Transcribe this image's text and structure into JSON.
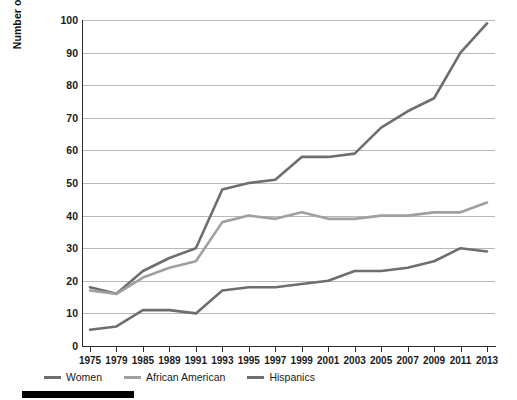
{
  "chart_data": {
    "type": "line",
    "title": "",
    "xlabel": "",
    "ylabel": "Number of  Women, African Americans, and Hispanics in the Congress",
    "x": [
      1975,
      1979,
      1985,
      1989,
      1991,
      1993,
      1995,
      1997,
      1999,
      2001,
      2003,
      2005,
      2007,
      2009,
      2011,
      2013
    ],
    "xticklabels": [
      "1975",
      "1979",
      "1985",
      "1989",
      "1991",
      "1993",
      "1995",
      "1997",
      "1999",
      "2001",
      "2003",
      "2005",
      "2007",
      "2009",
      "2011",
      "2013"
    ],
    "yticks": [
      0,
      10,
      20,
      30,
      40,
      50,
      60,
      70,
      80,
      90,
      100
    ],
    "yticklabels": [
      "0",
      "10",
      "20",
      "30",
      "40",
      "50",
      "60",
      "70",
      "80",
      "90",
      "100"
    ],
    "ylim": [
      0,
      100
    ],
    "grid": true,
    "legend_position": "below-axis-left",
    "series": [
      {
        "name": "Women",
        "color": "#6e6e6e",
        "values": [
          18,
          16,
          23,
          27,
          30,
          48,
          50,
          51,
          58,
          58,
          59,
          67,
          72,
          76,
          90,
          99
        ]
      },
      {
        "name": "African American",
        "color": "#a0a0a0",
        "values": [
          17,
          16,
          21,
          24,
          26,
          38,
          40,
          39,
          41,
          39,
          39,
          40,
          40,
          41,
          41,
          44
        ]
      },
      {
        "name": "Hispanics",
        "color": "#6e6e6e",
        "values": [
          5,
          6,
          11,
          11,
          10,
          17,
          18,
          18,
          19,
          20,
          23,
          23,
          24,
          26,
          30,
          29
        ]
      }
    ]
  },
  "legend": {
    "items": [
      {
        "label": "Women",
        "color": "#6e6e6e"
      },
      {
        "label": "African American",
        "color": "#a0a0a0"
      },
      {
        "label": "Hispanics",
        "color": "#6e6e6e"
      }
    ]
  }
}
